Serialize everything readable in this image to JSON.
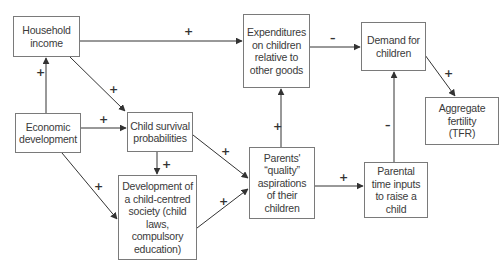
{
  "diagram": {
    "nodes": [
      {
        "id": "household_income",
        "label": "Household\nincome",
        "x": 13,
        "y": 16,
        "w": 67,
        "h": 41
      },
      {
        "id": "economic_development",
        "label": "Economic\ndevelopment",
        "x": 15,
        "y": 113,
        "w": 66,
        "h": 40
      },
      {
        "id": "child_survival",
        "label": "Child survival\nprobabilities",
        "x": 127,
        "y": 112,
        "w": 66,
        "h": 40
      },
      {
        "id": "child_centred_society",
        "label": "Development of\na child-centred\nsociety (child\nlaws,\ncompulsory\neducation)",
        "x": 118,
        "y": 175,
        "w": 79,
        "h": 85
      },
      {
        "id": "expenditures",
        "label": "Expenditures\non children\nrelative to\nother goods",
        "x": 243,
        "y": 14,
        "w": 67,
        "h": 74
      },
      {
        "id": "demand",
        "label": "Demand for\nchildren",
        "x": 361,
        "y": 22,
        "w": 65,
        "h": 49
      },
      {
        "id": "aggregate_fertility",
        "label": "Aggregate\nfertility\n(TFR)",
        "x": 425,
        "y": 97,
        "w": 74,
        "h": 48
      },
      {
        "id": "quality_aspirations",
        "label": "Parents'\n“quality”\naspirations\nof their\nchildren",
        "x": 249,
        "y": 147,
        "w": 66,
        "h": 72
      },
      {
        "id": "parental_time",
        "label": "Parental\ntime inputs\nto raise a\nchild",
        "x": 364,
        "y": 162,
        "w": 64,
        "h": 56
      }
    ],
    "edges": [
      {
        "from": "economic_development",
        "to": "household_income",
        "sign": "+",
        "x1": 46,
        "y1": 113,
        "x2": 46,
        "y2": 58,
        "sx": 36,
        "sy": 67
      },
      {
        "from": "household_income",
        "to": "expenditures",
        "sign": "+",
        "x1": 80,
        "y1": 41,
        "x2": 242,
        "y2": 41,
        "sx": 184,
        "sy": 26
      },
      {
        "from": "household_income",
        "to": "child_survival",
        "sign": "+",
        "x1": 70,
        "y1": 57,
        "x2": 125,
        "y2": 111,
        "sx": 109,
        "sy": 84
      },
      {
        "from": "economic_development",
        "to": "child_survival",
        "sign": "+",
        "x1": 81,
        "y1": 128,
        "x2": 126,
        "y2": 128,
        "sx": 99,
        "sy": 114
      },
      {
        "from": "economic_development",
        "to": "child_centred_society",
        "sign": "+",
        "x1": 62,
        "y1": 153,
        "x2": 117,
        "y2": 219,
        "sx": 94,
        "sy": 181
      },
      {
        "from": "child_survival",
        "to": "child_centred_society",
        "sign": "+",
        "x1": 157,
        "y1": 152,
        "x2": 157,
        "y2": 174,
        "sx": 162,
        "sy": 159
      },
      {
        "from": "child_survival",
        "to": "quality_aspirations",
        "sign": "+",
        "x1": 193,
        "y1": 135,
        "x2": 248,
        "y2": 178,
        "sx": 221,
        "sy": 146
      },
      {
        "from": "child_centred_society",
        "to": "quality_aspirations",
        "sign": "+",
        "x1": 197,
        "y1": 228,
        "x2": 248,
        "y2": 189,
        "sx": 219,
        "sy": 196
      },
      {
        "from": "quality_aspirations",
        "to": "expenditures",
        "sign": "+",
        "x1": 281,
        "y1": 147,
        "x2": 281,
        "y2": 89,
        "sx": 273,
        "sy": 121
      },
      {
        "from": "quality_aspirations",
        "to": "parental_time",
        "sign": "+",
        "x1": 315,
        "y1": 186,
        "x2": 363,
        "y2": 186,
        "sx": 339,
        "sy": 172
      },
      {
        "from": "expenditures",
        "to": "demand",
        "sign": "–",
        "x1": 310,
        "y1": 47,
        "x2": 360,
        "y2": 47,
        "sx": 330,
        "sy": 33
      },
      {
        "from": "parental_time",
        "to": "demand",
        "sign": "–",
        "x1": 394,
        "y1": 162,
        "x2": 394,
        "y2": 72,
        "sx": 385,
        "sy": 120
      },
      {
        "from": "demand",
        "to": "aggregate_fertility",
        "sign": "+",
        "x1": 425,
        "y1": 55,
        "x2": 455,
        "y2": 96,
        "sx": 444,
        "sy": 68
      }
    ]
  },
  "colors": {
    "box_border": "#7a7a7a",
    "arrow": "#333333",
    "text": "#3a3a3a",
    "background": "#ffffff"
  }
}
